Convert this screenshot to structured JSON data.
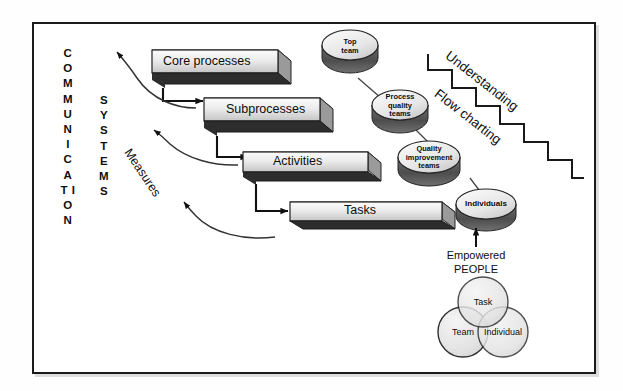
{
  "diagram": {
    "vertical_labels": [
      {
        "name": "communication",
        "text": "C O M M U N I C A T I O N"
      },
      {
        "name": "systems",
        "text": "S Y S T E M S"
      }
    ],
    "process_boxes": [
      {
        "id": "core-processes",
        "label": "Core processes"
      },
      {
        "id": "subprocesses",
        "label": "Subprocesses"
      },
      {
        "id": "activities",
        "label": "Activities"
      },
      {
        "id": "tasks",
        "label": "Tasks"
      }
    ],
    "measures_label": "Measures",
    "team_cylinders": [
      {
        "id": "top-team",
        "lines": [
          "Top",
          "team"
        ]
      },
      {
        "id": "process-quality-teams",
        "lines": [
          "Process",
          "quality",
          "teams"
        ]
      },
      {
        "id": "quality-improvement-teams",
        "lines": [
          "Quality",
          "improvement",
          "teams"
        ]
      },
      {
        "id": "individuals",
        "lines": [
          "Individuals"
        ]
      }
    ],
    "empowered_people": {
      "line1": "Empowered",
      "line2": "PEOPLE"
    },
    "staircase_labels": [
      {
        "id": "understanding",
        "text": "Understanding"
      },
      {
        "id": "flow-charting",
        "text": "Flow charting"
      }
    ],
    "venn_circles": [
      {
        "id": "task",
        "label": "Task"
      },
      {
        "id": "team",
        "label": "Team"
      },
      {
        "id": "individual",
        "label": "Individual"
      }
    ],
    "colors": {
      "box_face_light": "#f2f2f2",
      "box_face_dark": "#c9c9c9",
      "box_shadow_face": "#2b2b2b",
      "box_side": "#8f8f8f",
      "cylinder_top": "#e8e8e8",
      "cylinder_side": "#5a5a5a",
      "venn_fill": "#e4e4e4",
      "line": "#1a1a1a",
      "frame": "#1a1a1a",
      "background": "#ffffff"
    }
  }
}
